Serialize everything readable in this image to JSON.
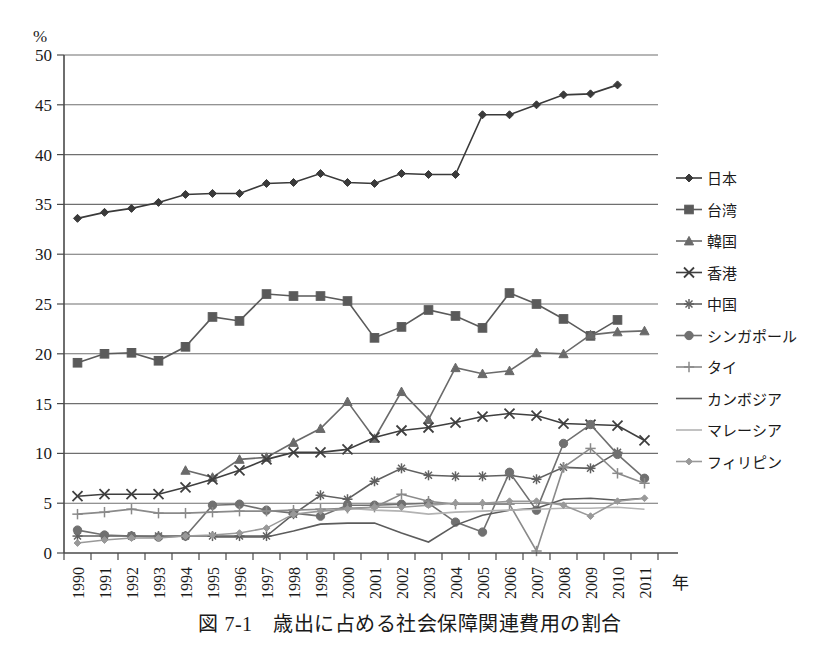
{
  "figure": {
    "caption": "図 7-1　歳出に占める社会保障関連費用の割合",
    "y_unit": "%",
    "x_unit": "年"
  },
  "chart_data": {
    "type": "line",
    "title": "図 7-1　歳出に占める社会保障関連費用の割合",
    "xlabel": "年",
    "ylabel": "%",
    "ylim": [
      0,
      50
    ],
    "ytick_step": 5,
    "yticks": [
      0,
      5,
      10,
      15,
      20,
      25,
      30,
      35,
      40,
      45,
      50
    ],
    "grid": true,
    "legend_position": "right",
    "categories": [
      "1990",
      "1991",
      "1992",
      "1993",
      "1994",
      "1995",
      "1996",
      "1997",
      "1998",
      "1999",
      "2000",
      "2001",
      "2002",
      "2003",
      "2004",
      "2005",
      "2006",
      "2007",
      "2008",
      "2009",
      "2010",
      "2011"
    ],
    "series": [
      {
        "name": "日本",
        "marker": "diamond",
        "color": "#3a3a3a",
        "values": [
          33.6,
          34.2,
          34.6,
          35.2,
          36.0,
          36.1,
          36.1,
          37.1,
          37.2,
          38.1,
          37.2,
          37.1,
          38.1,
          38.0,
          38.0,
          44.0,
          44.0,
          45.0,
          46.0,
          46.1,
          47.0,
          null
        ]
      },
      {
        "name": "台湾",
        "marker": "square",
        "color": "#5a5a5a",
        "values": [
          19.1,
          20.0,
          20.1,
          19.3,
          20.7,
          23.7,
          23.3,
          26.0,
          25.8,
          25.8,
          25.3,
          21.6,
          22.7,
          24.4,
          23.8,
          22.6,
          26.1,
          25.0,
          23.5,
          21.8,
          23.4,
          null
        ]
      },
      {
        "name": "韓国",
        "marker": "triangle",
        "color": "#6a6a6a",
        "values": [
          null,
          null,
          null,
          null,
          8.3,
          7.6,
          9.4,
          9.6,
          11.1,
          12.5,
          15.2,
          11.5,
          16.2,
          13.4,
          18.6,
          18.0,
          18.3,
          20.1,
          20.0,
          21.9,
          22.2,
          22.3
        ]
      },
      {
        "name": "香港",
        "marker": "x",
        "color": "#3f3f3f",
        "values": [
          5.7,
          5.9,
          5.9,
          5.9,
          6.6,
          7.4,
          8.3,
          9.4,
          10.1,
          10.1,
          10.4,
          11.6,
          12.3,
          12.6,
          13.1,
          13.7,
          14.0,
          13.8,
          13.0,
          12.9,
          12.8,
          11.3
        ]
      },
      {
        "name": "中国",
        "marker": "asterisk",
        "color": "#606060",
        "values": [
          1.7,
          1.7,
          1.7,
          1.7,
          1.7,
          1.7,
          1.7,
          1.7,
          3.9,
          5.8,
          5.4,
          7.2,
          8.5,
          7.8,
          7.7,
          7.7,
          7.8,
          7.4,
          8.6,
          8.5,
          10.1,
          null
        ]
      },
      {
        "name": "シンガポール",
        "marker": "circle",
        "color": "#707070",
        "values": [
          2.3,
          1.8,
          1.7,
          1.6,
          1.7,
          4.8,
          4.9,
          4.3,
          4.0,
          3.7,
          4.8,
          4.8,
          4.9,
          5.0,
          3.1,
          2.1,
          8.1,
          4.3,
          11.0,
          12.9,
          9.9,
          7.5
        ]
      },
      {
        "name": "タイ",
        "marker": "plus",
        "color": "#8a8a8a",
        "values": [
          3.9,
          4.1,
          4.4,
          4.0,
          4.0,
          4.1,
          4.2,
          4.2,
          4.3,
          4.4,
          4.5,
          4.6,
          5.9,
          5.2,
          4.9,
          4.9,
          4.9,
          0.2,
          8.6,
          10.5,
          8.0,
          7.0
        ]
      },
      {
        "name": "カンボジア",
        "marker": "none",
        "color": "#5c5c5c",
        "values": [
          null,
          null,
          null,
          null,
          null,
          1.6,
          1.6,
          1.6,
          2.2,
          2.9,
          3.0,
          3.0,
          2.0,
          1.1,
          2.8,
          3.8,
          4.3,
          4.5,
          5.4,
          5.5,
          5.3,
          5.5
        ]
      },
      {
        "name": "マレーシア",
        "marker": "none",
        "color": "#b3b3b3",
        "values": [
          null,
          null,
          null,
          null,
          null,
          null,
          null,
          null,
          null,
          null,
          4.5,
          4.3,
          4.2,
          3.9,
          4.1,
          4.2,
          4.3,
          4.4,
          4.5,
          4.5,
          4.6,
          4.4
        ]
      },
      {
        "name": "フィリピン",
        "marker": "smalldiamond",
        "color": "#999999",
        "values": [
          1.0,
          1.3,
          1.5,
          1.5,
          1.7,
          1.8,
          2.0,
          2.5,
          3.9,
          4.2,
          4.4,
          4.6,
          4.6,
          4.8,
          5.0,
          5.0,
          5.2,
          5.2,
          4.8,
          3.7,
          5.2,
          5.5
        ]
      }
    ]
  },
  "legend": {
    "items": [
      {
        "label": "日本"
      },
      {
        "label": "台湾"
      },
      {
        "label": "韓国"
      },
      {
        "label": "香港"
      },
      {
        "label": "中国"
      },
      {
        "label": "シンガポール"
      },
      {
        "label": "タイ"
      },
      {
        "label": "カンボジア"
      },
      {
        "label": "マレーシア"
      },
      {
        "label": "フィリピン"
      }
    ]
  }
}
